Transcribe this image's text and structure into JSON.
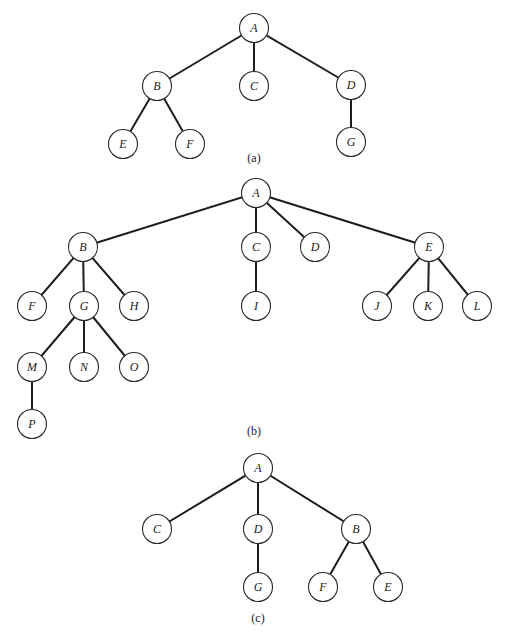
{
  "figure": {
    "node_radius": 14.5,
    "colors": {
      "edge": "#1e1e1e",
      "node_stroke": "#2a2a2a",
      "node_fill": "#ffffff",
      "text": "#222222",
      "background": "#ffffff"
    },
    "trees": [
      {
        "id": "a",
        "caption": "(a)",
        "caption_pos": [
          254,
          158
        ],
        "nodes": [
          {
            "id": "A",
            "label": "A",
            "x": 254,
            "y": 28
          },
          {
            "id": "B",
            "label": "B",
            "x": 157,
            "y": 86
          },
          {
            "id": "C",
            "label": "C",
            "x": 254,
            "y": 86
          },
          {
            "id": "D",
            "label": "D",
            "x": 351,
            "y": 85
          },
          {
            "id": "E",
            "label": "E",
            "x": 123,
            "y": 144
          },
          {
            "id": "F",
            "label": "F",
            "x": 190,
            "y": 144
          },
          {
            "id": "G",
            "label": "G",
            "x": 351,
            "y": 142
          }
        ],
        "edges": [
          [
            "A",
            "B"
          ],
          [
            "A",
            "C"
          ],
          [
            "A",
            "D"
          ],
          [
            "B",
            "E"
          ],
          [
            "B",
            "F"
          ],
          [
            "D",
            "G"
          ]
        ]
      },
      {
        "id": "b",
        "caption": "(b)",
        "caption_pos": [
          254,
          431
        ],
        "nodes": [
          {
            "id": "A",
            "label": "A",
            "x": 256,
            "y": 193
          },
          {
            "id": "B",
            "label": "B",
            "x": 83,
            "y": 247
          },
          {
            "id": "C",
            "label": "C",
            "x": 256,
            "y": 247
          },
          {
            "id": "D",
            "label": "D",
            "x": 315,
            "y": 247
          },
          {
            "id": "E",
            "label": "E",
            "x": 429,
            "y": 247
          },
          {
            "id": "F",
            "label": "F",
            "x": 32,
            "y": 306
          },
          {
            "id": "G",
            "label": "G",
            "x": 84,
            "y": 306
          },
          {
            "id": "H",
            "label": "H",
            "x": 134,
            "y": 306
          },
          {
            "id": "I",
            "label": "I",
            "x": 256,
            "y": 306
          },
          {
            "id": "J",
            "label": "J",
            "x": 377,
            "y": 306
          },
          {
            "id": "K",
            "label": "K",
            "x": 428,
            "y": 306
          },
          {
            "id": "L",
            "label": "L",
            "x": 477,
            "y": 306
          },
          {
            "id": "M",
            "label": "M",
            "x": 32,
            "y": 367
          },
          {
            "id": "N",
            "label": "N",
            "x": 84,
            "y": 367
          },
          {
            "id": "O",
            "label": "O",
            "x": 134,
            "y": 367
          },
          {
            "id": "P",
            "label": "P",
            "x": 32,
            "y": 424
          }
        ],
        "edges": [
          [
            "A",
            "B"
          ],
          [
            "A",
            "C"
          ],
          [
            "A",
            "D"
          ],
          [
            "A",
            "E"
          ],
          [
            "B",
            "F"
          ],
          [
            "B",
            "G"
          ],
          [
            "B",
            "H"
          ],
          [
            "C",
            "I"
          ],
          [
            "E",
            "J"
          ],
          [
            "E",
            "K"
          ],
          [
            "E",
            "L"
          ],
          [
            "G",
            "M"
          ],
          [
            "G",
            "N"
          ],
          [
            "G",
            "O"
          ],
          [
            "M",
            "P"
          ]
        ]
      },
      {
        "id": "c",
        "caption": "(c)",
        "caption_pos": [
          258,
          618
        ],
        "nodes": [
          {
            "id": "A",
            "label": "A",
            "x": 258,
            "y": 468
          },
          {
            "id": "C",
            "label": "C",
            "x": 157,
            "y": 529
          },
          {
            "id": "D",
            "label": "D",
            "x": 258,
            "y": 529
          },
          {
            "id": "B",
            "label": "B",
            "x": 356,
            "y": 529
          },
          {
            "id": "G",
            "label": "G",
            "x": 258,
            "y": 587
          },
          {
            "id": "F",
            "label": "F",
            "x": 323,
            "y": 587
          },
          {
            "id": "E",
            "label": "E",
            "x": 388,
            "y": 587
          }
        ],
        "edges": [
          [
            "A",
            "C"
          ],
          [
            "A",
            "D"
          ],
          [
            "A",
            "B"
          ],
          [
            "D",
            "G"
          ],
          [
            "B",
            "F"
          ],
          [
            "B",
            "E"
          ]
        ]
      }
    ]
  }
}
